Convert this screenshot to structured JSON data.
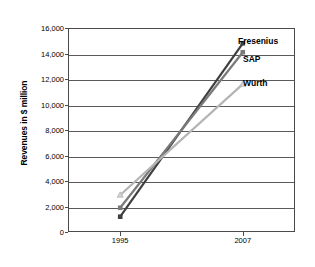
{
  "chart_data": {
    "type": "line",
    "title": "",
    "xlabel": "",
    "ylabel": "Revenues in $ million",
    "categories": [
      "1995",
      "2007"
    ],
    "ylim": [
      0,
      16000
    ],
    "yticks": [
      0,
      2000,
      4000,
      6000,
      8000,
      10000,
      12000,
      14000,
      16000
    ],
    "ytick_labels": [
      "0",
      "2,000",
      "4,000",
      "6,000",
      "8,000",
      "10,000",
      "12,000",
      "14,000",
      "16,000"
    ],
    "grid": true,
    "legend_position": "inline-right-end",
    "series": [
      {
        "name": "Fresenius",
        "values": [
          1200,
          14800
        ],
        "color": "#3f3f3f",
        "marker": "square",
        "label_top": 36,
        "label_left": 238
      },
      {
        "name": "SAP",
        "values": [
          1900,
          14100
        ],
        "color": "#7a7a7a",
        "marker": "square",
        "label_top": 54,
        "label_left": 243
      },
      {
        "name": "Würth",
        "values": [
          2900,
          11600
        ],
        "color": "#b4b4b4",
        "marker": "triangle",
        "label_top": 78,
        "label_left": 243
      }
    ]
  },
  "axes": {
    "y_title": "Revenues in $ million",
    "x_category_first": "1995",
    "x_category_second": "2007"
  },
  "colors": {
    "axis": "#4a4a4a",
    "gridline": "#5a5a5a",
    "background": "#ffffff",
    "text": "#000000"
  }
}
